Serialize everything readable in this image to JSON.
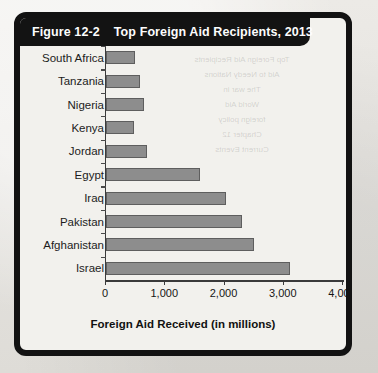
{
  "figure": {
    "number": "Figure 12-2",
    "title": "Top Foreign Aid Recipients, 2013"
  },
  "colors": {
    "header_background": "#131313",
    "header_text": "#fdfdfd",
    "bar_fill": "#8d8d8d",
    "bar_stroke": "#5e5e5e",
    "axis": "#3a3a3a",
    "card_background": "#f2f1ed",
    "page_background": "#e8e7e3"
  },
  "bleed_through": {
    "line1": "Top Foreign Aid Recipients",
    "line2": "Aid to Needy Nations",
    "line3": "The war in",
    "line4": "World Aid",
    "line5": "foreign policy",
    "line6": "Chapter 12",
    "line7": "Current Events"
  },
  "chart_data": {
    "type": "bar",
    "orientation": "horizontal",
    "title": "Top Foreign Aid Recipients, 2013",
    "xlabel": "Foreign Aid Received (in millions)",
    "ylabel": "",
    "xlim": [
      0,
      4000
    ],
    "xticks": [
      0,
      1000,
      2000,
      3000,
      4000
    ],
    "xticklabels": [
      "0",
      "1,000",
      "2,000",
      "3,000",
      "4,000"
    ],
    "grid": false,
    "legend": false,
    "categories": [
      "South Africa",
      "Tanzania",
      "Nigeria",
      "Kenya",
      "Jordan",
      "Egypt",
      "Iraq",
      "Pakistan",
      "Afghanistan",
      "Israel"
    ],
    "values": [
      490,
      570,
      640,
      470,
      690,
      1580,
      2020,
      2300,
      2500,
      3100
    ]
  }
}
